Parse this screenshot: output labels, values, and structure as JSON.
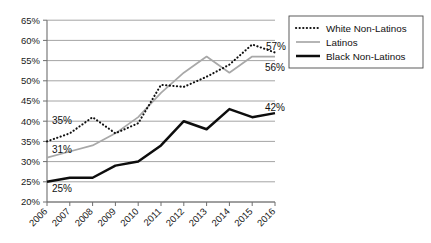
{
  "chart_data": {
    "type": "line",
    "title": "",
    "subtitle": "",
    "xlabel": "",
    "ylabel": "",
    "categories": [
      "2006",
      "2007",
      "2008",
      "2009",
      "2010",
      "2011",
      "2012",
      "2013",
      "2014",
      "2015",
      "2016"
    ],
    "ylim": [
      20,
      65
    ],
    "ytick_labels": [
      "20%",
      "25%",
      "30%",
      "35%",
      "40%",
      "45%",
      "50%",
      "55%",
      "60%",
      "65%"
    ],
    "ytick_values": [
      20,
      25,
      30,
      35,
      40,
      45,
      50,
      55,
      60,
      65
    ],
    "grid": true,
    "legend_position": "top-right",
    "series": [
      {
        "name": "White Non-Latinos",
        "style": "dotted",
        "color": "#111111",
        "values": [
          35,
          37,
          41,
          37,
          39.5,
          49,
          48.5,
          51,
          54,
          59,
          57
        ]
      },
      {
        "name": "Latinos",
        "style": "solid-thin",
        "color": "#a8a8a8",
        "values": [
          31,
          32.5,
          34,
          37,
          41,
          47,
          52,
          56,
          52,
          56,
          56
        ]
      },
      {
        "name": "Black Non-Latinos",
        "style": "solid-thick",
        "color": "#0d0d0d",
        "values": [
          25,
          26,
          26,
          29,
          30,
          34,
          40,
          38,
          43,
          41,
          42
        ]
      }
    ],
    "annotations": [
      {
        "text": "35%",
        "series": "White Non-Latinos",
        "x": "2006",
        "value": 35,
        "position": "left"
      },
      {
        "text": "31%",
        "series": "Latinos",
        "x": "2006",
        "value": 31,
        "position": "left"
      },
      {
        "text": "25%",
        "series": "Black Non-Latinos",
        "x": "2006",
        "value": 25,
        "position": "left-below"
      },
      {
        "text": "57%",
        "series": "White Non-Latinos",
        "x": "2016",
        "value": 57,
        "position": "right"
      },
      {
        "text": "56%",
        "series": "Latinos",
        "x": "2016",
        "value": 56,
        "position": "right-below"
      },
      {
        "text": "42%",
        "series": "Black Non-Latinos",
        "x": "2016",
        "value": 42,
        "position": "right-above"
      }
    ]
  },
  "legend": {
    "entries": [
      {
        "label": "White Non-Latinos"
      },
      {
        "label": "Latinos"
      },
      {
        "label": "Black Non-Latinos"
      }
    ]
  },
  "axis": {
    "y_labels": [
      "65%",
      "60%",
      "55%",
      "50%",
      "45%",
      "40%",
      "35%",
      "30%",
      "25%",
      "20%"
    ],
    "x_labels": [
      "2006",
      "2007",
      "2008",
      "2009",
      "2010",
      "2011",
      "2012",
      "2013",
      "2014",
      "2015",
      "2016"
    ]
  },
  "point_labels": {
    "white_start": "35%",
    "latinos_start": "31%",
    "black_start": "25%",
    "white_end": "57%",
    "latinos_end": "56%",
    "black_end": "42%"
  }
}
